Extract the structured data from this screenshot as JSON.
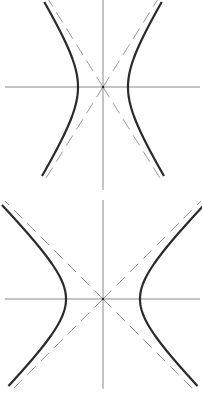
{
  "diagrams": [
    {
      "name": "hyperbola-narrow",
      "type": "horizontal hyperbola x^2/a^2 - y^2/b^2 = 1",
      "a": 25,
      "b": 40,
      "asymptote_slope": 1.6,
      "colors": {
        "curve": "#2a2a2a",
        "axis": "#8a8a8a",
        "asymptote": "#9a9a9a"
      }
    },
    {
      "name": "hyperbola-wide",
      "type": "horizontal hyperbola x^2/a^2 - y^2/b^2 = 1",
      "a": 37,
      "b": 37,
      "asymptote_slope": 1.0,
      "colors": {
        "curve": "#2a2a2a",
        "axis": "#8a8a8a",
        "asymptote": "#9a9a9a"
      }
    }
  ]
}
